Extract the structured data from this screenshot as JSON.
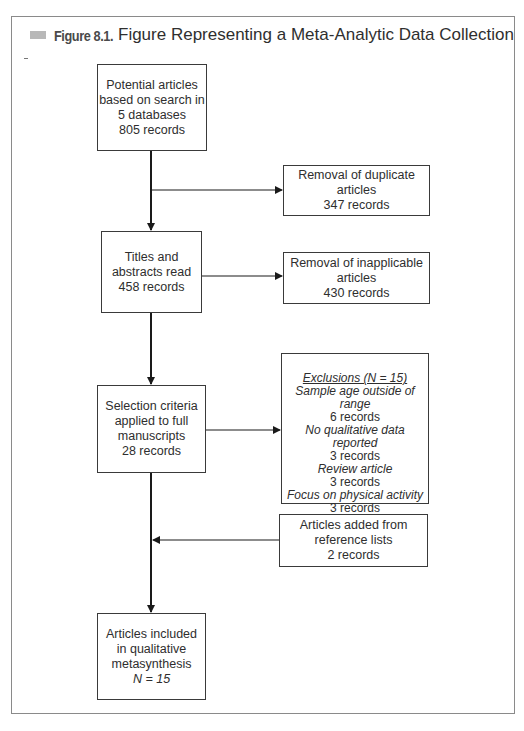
{
  "figure": {
    "number_label": "Figure 8.1.",
    "title": "Figure Representing a Meta-Analytic Data Collection"
  },
  "nodes": {
    "potential": {
      "lines": [
        "Potential articles",
        "based on search in",
        "5 databases",
        "805 records"
      ]
    },
    "duplicates": {
      "lines": [
        "Removal of duplicate",
        "articles",
        "347 records"
      ]
    },
    "titles": {
      "lines": [
        "Titles and",
        "abstracts read",
        "458 records"
      ]
    },
    "inapplicable": {
      "lines": [
        "Removal of inapplicable",
        "articles",
        "430 records"
      ]
    },
    "selection": {
      "lines": [
        "Selection criteria",
        "applied to full",
        "manuscripts",
        "28 records"
      ]
    },
    "exclusions": {
      "heading": "Exclusions (N = 15)",
      "items": [
        {
          "reason": "Sample age outside of range",
          "count": "6 records"
        },
        {
          "reason": "No qualitative data reported",
          "count": "3 records"
        },
        {
          "reason": "Review article",
          "count": "3 records"
        },
        {
          "reason": "Focus on physical activity",
          "count": "3 records"
        }
      ]
    },
    "added": {
      "lines": [
        "Articles added from",
        "reference lists",
        "2 records"
      ]
    },
    "included": {
      "lines": [
        "Articles included",
        "in qualitative",
        "metasynthesis"
      ],
      "n_label": "N = 15"
    }
  },
  "edges": [
    {
      "from": "potential",
      "to": "titles"
    },
    {
      "from": "potential",
      "to": "duplicates"
    },
    {
      "from": "titles",
      "to": "selection"
    },
    {
      "from": "titles",
      "to": "inapplicable"
    },
    {
      "from": "selection",
      "to": "exclusions"
    },
    {
      "from": "selection",
      "to": "included"
    },
    {
      "from": "added",
      "to": "included"
    }
  ],
  "colors": {
    "line": "#1a1a1a",
    "box_border": "#3a3a3a",
    "frame_border": "#8a8a8a",
    "title_marker": "#b8b8b8"
  }
}
